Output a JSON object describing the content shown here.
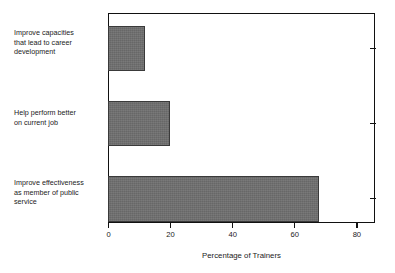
{
  "chart_data": {
    "type": "bar",
    "orientation": "horizontal",
    "title": "",
    "xlabel": "Percentage of Trainers",
    "ylabel": "",
    "categories": [
      "Improve capacities\nthat lead to career\ndevelopment",
      "Help perform better\non current job",
      "Improve effectiveness\nas member of public\nservice"
    ],
    "values": [
      12,
      20,
      68
    ],
    "xlim": [
      0,
      86
    ],
    "xticks": [
      0,
      20,
      40,
      60,
      80
    ],
    "xtick_labels": [
      "0",
      "20",
      "40",
      "60",
      "80"
    ],
    "grid": false,
    "legend": null,
    "bar_color": "#6e6e6e",
    "bar_edge_color": "#3a3a3a",
    "axis_color": "#111111",
    "background_color": "#ffffff"
  }
}
